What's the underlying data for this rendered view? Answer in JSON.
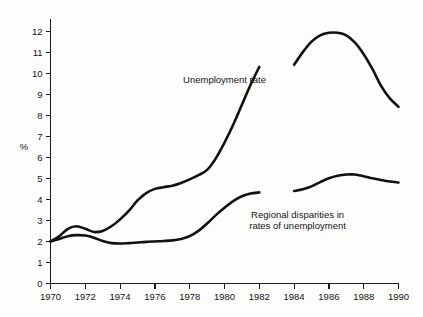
{
  "chart_data": {
    "type": "line",
    "title": "",
    "subtitle": "",
    "xlabel": "",
    "ylabel": "%",
    "xlim": [
      1970,
      1990
    ],
    "ylim": [
      0,
      12.6
    ],
    "grid": false,
    "legend": "none (inline annotations)",
    "x_ticks": [
      1970,
      1971,
      1972,
      1973,
      1974,
      1975,
      1976,
      1977,
      1978,
      1979,
      1980,
      1981,
      1982,
      1983,
      1984,
      1985,
      1986,
      1987,
      1988,
      1989,
      1990
    ],
    "x_tick_labels": [
      "1970",
      "",
      "1972",
      "",
      "1974",
      "",
      "1976",
      "",
      "1978",
      "",
      "1980",
      "",
      "1982",
      "",
      "1984",
      "",
      "1986",
      "",
      "1988",
      "",
      "1990"
    ],
    "y_ticks": [
      0,
      1,
      2,
      3,
      4,
      5,
      6,
      7,
      8,
      9,
      10,
      11,
      12
    ],
    "y_tick_labels": [
      "0",
      "1",
      "2",
      "3",
      "4",
      "5",
      "6",
      "7",
      "8",
      "9",
      "10",
      "11",
      "12"
    ],
    "series": [
      {
        "name": "Unemployment rate",
        "color": "#111111",
        "segments": [
          {
            "x": [
              1970,
              1970.5,
              1971,
              1971.5,
              1972,
              1972.5,
              1973,
              1973.5,
              1974,
              1974.5,
              1975,
              1975.5,
              1976,
              1976.5,
              1977,
              1977.5,
              1978,
              1978.5,
              1979,
              1979.5,
              1980,
              1980.5,
              1981,
              1981.5,
              1982
            ],
            "y": [
              2.0,
              2.25,
              2.6,
              2.72,
              2.6,
              2.45,
              2.5,
              2.72,
              3.05,
              3.45,
              3.95,
              4.3,
              4.5,
              4.58,
              4.65,
              4.78,
              4.95,
              5.15,
              5.4,
              5.95,
              6.7,
              7.55,
              8.5,
              9.45,
              10.3
            ]
          },
          {
            "x": [
              1984,
              1984.5,
              1985,
              1985.5,
              1986,
              1986.5,
              1987,
              1987.5,
              1988,
              1988.5,
              1989,
              1989.5,
              1990
            ],
            "y": [
              10.4,
              11.0,
              11.5,
              11.8,
              11.92,
              11.92,
              11.8,
              11.45,
              10.9,
              10.2,
              9.4,
              8.8,
              8.4
            ]
          }
        ]
      },
      {
        "name": "Regional disparities in rates of unemployment",
        "color": "#111111",
        "segments": [
          {
            "x": [
              1970,
              1970.5,
              1971,
              1971.5,
              1972,
              1972.5,
              1973,
              1973.5,
              1974,
              1974.5,
              1975,
              1975.5,
              1976,
              1976.5,
              1977,
              1977.5,
              1978,
              1978.5,
              1979,
              1979.5,
              1980,
              1980.5,
              1981,
              1981.5,
              1982
            ],
            "y": [
              2.0,
              2.12,
              2.25,
              2.3,
              2.28,
              2.18,
              2.02,
              1.92,
              1.9,
              1.92,
              1.95,
              1.98,
              2.0,
              2.02,
              2.05,
              2.12,
              2.25,
              2.5,
              2.85,
              3.25,
              3.6,
              3.92,
              4.15,
              4.28,
              4.33
            ]
          },
          {
            "x": [
              1984,
              1984.5,
              1985,
              1985.5,
              1986,
              1986.5,
              1987,
              1987.5,
              1988,
              1988.5,
              1989,
              1989.5,
              1990
            ],
            "y": [
              4.4,
              4.48,
              4.62,
              4.82,
              5.0,
              5.12,
              5.18,
              5.18,
              5.1,
              5.0,
              4.92,
              4.85,
              4.8
            ]
          }
        ]
      }
    ],
    "annotations": [
      {
        "id": "unemployment-rate-label",
        "text": "Unemployment rate",
        "lines": [
          "Unemployment rate"
        ],
        "x": 1980.0,
        "y": 9.55
      },
      {
        "id": "regional-disparities-label",
        "text": "Regional disparities in rates of unemployment",
        "lines": [
          "Regional disparities in",
          "rates of unemployment"
        ],
        "x": 1984.2,
        "y": 3.12
      }
    ]
  }
}
